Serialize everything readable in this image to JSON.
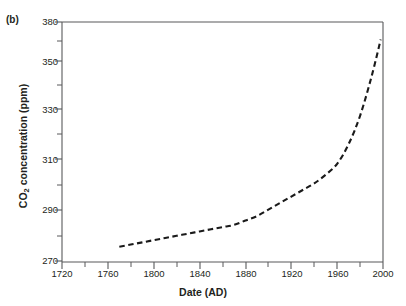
{
  "figure": {
    "panel_label": "(b)",
    "background_color": "#ffffff",
    "frame_color": "#58595b",
    "text_color": "#231f20",
    "curve_color": "#1a1a1a"
  },
  "chart_data": {
    "type": "line",
    "title": "",
    "subtitle": "",
    "panel": "(b)",
    "xlabel": "Date (AD)",
    "ylabel": "CO2 concentration (ppm)",
    "ylabel_display": "CO₂ concentration (ppm)",
    "xlim": [
      1720,
      2000
    ],
    "ylim": [
      270,
      380
    ],
    "xticks": [
      1720,
      1760,
      1800,
      1840,
      1880,
      1920,
      1960,
      2000
    ],
    "xtick_labels": [
      "1720",
      "1760",
      "1800",
      "1840",
      "1880",
      "1920",
      "1960",
      "2000"
    ],
    "x_minor_tick_interval": 20,
    "yticks": [
      270,
      290,
      310,
      330,
      350,
      380
    ],
    "ytick_labels": [
      "270",
      "290",
      "310",
      "330",
      "350",
      "380"
    ],
    "y_minor_ticks": [
      280,
      300,
      320,
      340,
      365
    ],
    "grid": false,
    "legend": null,
    "line_style": "dashed",
    "annotations": [],
    "series": [
      {
        "name": "CO2 concentration",
        "x": [
          1770,
          1780,
          1790,
          1800,
          1810,
          1820,
          1830,
          1840,
          1850,
          1860,
          1870,
          1880,
          1890,
          1900,
          1910,
          1920,
          1930,
          1940,
          1950,
          1960,
          1970,
          1980,
          1990,
          1998
        ],
        "values": [
          277,
          278,
          279,
          280,
          281,
          282,
          283,
          284,
          285,
          286,
          287,
          289,
          291,
          294,
          297,
          300,
          303,
          306,
          310,
          315,
          324,
          337,
          355,
          372
        ]
      }
    ]
  }
}
